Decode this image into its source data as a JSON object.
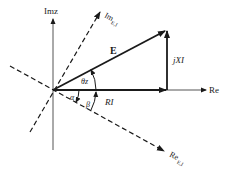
{
  "diagram": {
    "axes": {
      "imaginary_label": "Imz",
      "real_label": "Re"
    },
    "rotated_axes": {
      "imaginary_label_main": "Im",
      "imaginary_label_sub": "E,I",
      "real_label_main": "Re",
      "real_label_sub": "E,I"
    },
    "vectors": {
      "E_label": "E",
      "RI_label": "RI",
      "jXI_label": "jXI"
    },
    "angles": {
      "theta_z": "θz",
      "alpha": "α",
      "beta": "β"
    },
    "colors": {
      "ink": "#1a1a1a",
      "axis": "#555555"
    }
  }
}
